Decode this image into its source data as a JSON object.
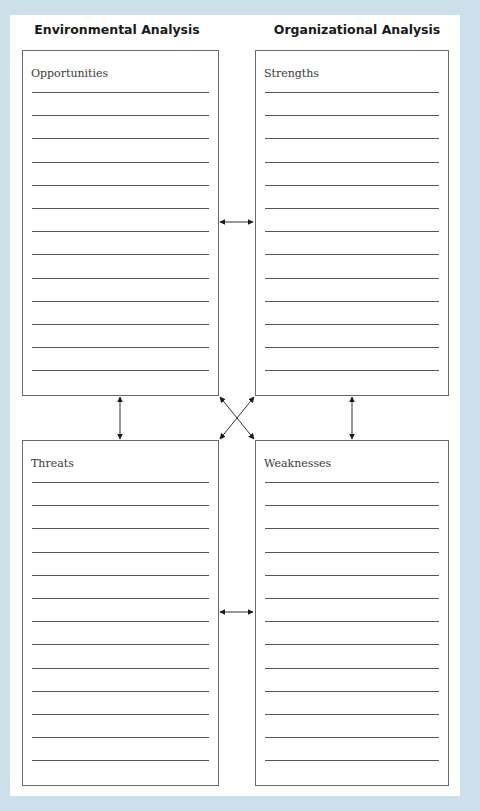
{
  "headings": {
    "left": "Environmental Analysis",
    "right": "Organizational Analysis"
  },
  "boxes": [
    {
      "id": "opportunities",
      "title": "Opportunities",
      "line_count": 13
    },
    {
      "id": "strengths",
      "title": "Strengths",
      "line_count": 13
    },
    {
      "id": "threats",
      "title": "Threats",
      "line_count": 13
    },
    {
      "id": "weaknesses",
      "title": "Weaknesses",
      "line_count": 13
    }
  ],
  "connectors": [
    {
      "from": "opportunities",
      "to": "strengths",
      "type": "bidirectional"
    },
    {
      "from": "threats",
      "to": "weaknesses",
      "type": "bidirectional"
    },
    {
      "from": "opportunities",
      "to": "threats",
      "type": "bidirectional"
    },
    {
      "from": "strengths",
      "to": "weaknesses",
      "type": "bidirectional"
    },
    {
      "from": "opportunities",
      "to": "weaknesses",
      "type": "bidirectional"
    },
    {
      "from": "strengths",
      "to": "threats",
      "type": "bidirectional"
    }
  ],
  "colors": {
    "background": "#cddfea",
    "card": "#ffffff",
    "line": "#555555"
  }
}
